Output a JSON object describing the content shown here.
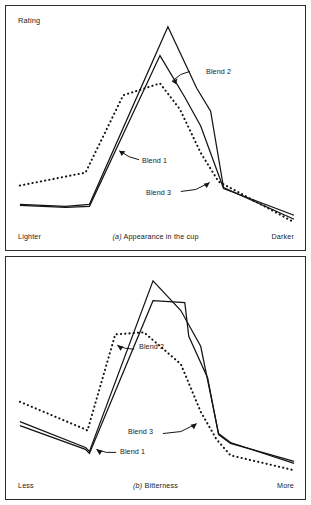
{
  "figure": {
    "y_axis_label": "Rating"
  },
  "panels": [
    {
      "id": "panel-a",
      "caption_prefix": "(a)",
      "caption_text": " Appearance in the cup",
      "axis_left": "Lighter",
      "axis_right": "Darker",
      "annotations": [
        {
          "label": "Blend 2"
        },
        {
          "label": "Blend 1"
        },
        {
          "label": "Blend 3"
        }
      ]
    },
    {
      "id": "panel-b",
      "caption_prefix": "(b)",
      "caption_text": " Bitterness",
      "axis_left": "Less",
      "axis_right": "More",
      "annotations": [
        {
          "label": "Blend 2"
        },
        {
          "label": "Blend 3"
        },
        {
          "label": "Blend 1"
        }
      ]
    }
  ],
  "chart_data": [
    {
      "type": "line",
      "title": "(a) Appearance in the cup",
      "xlabel": "",
      "ylabel": "Rating",
      "xlim": [
        0,
        301
      ],
      "ylim": [
        0,
        246
      ],
      "axis_left_label": "Lighter",
      "axis_right_label": "Darker",
      "grid": false,
      "legend": "inline-annotations",
      "note": "Coordinates are panel-local pixel positions; y increases downward in the source image. Lower y value = higher rating.",
      "series": [
        {
          "name": "Blend 1",
          "style": "solid",
          "color": "#141414",
          "points": [
            [
              14,
              200
            ],
            [
              60,
              202
            ],
            [
              84,
              200
            ],
            [
              163,
              21
            ],
            [
              192,
              83
            ],
            [
              206,
              106
            ],
            [
              219,
              183
            ],
            [
              290,
              215
            ]
          ]
        },
        {
          "name": "Blend 2",
          "style": "solid",
          "color": "#141414",
          "points": [
            [
              14,
              201
            ],
            [
              60,
              203
            ],
            [
              84,
              202
            ],
            [
              155,
              50
            ],
            [
              180,
              92
            ],
            [
              196,
              121
            ],
            [
              219,
              184
            ],
            [
              290,
              211
            ]
          ]
        },
        {
          "name": "Blend 3",
          "style": "dotted",
          "color": "#141414",
          "points": [
            [
              14,
              181
            ],
            [
              80,
              168
            ],
            [
              118,
              90
            ],
            [
              155,
              78
            ],
            [
              175,
              104
            ],
            [
              196,
              148
            ],
            [
              214,
              177
            ],
            [
              290,
              218
            ]
          ]
        }
      ]
    },
    {
      "type": "line",
      "title": "(b) Bitterness",
      "xlabel": "",
      "ylabel": "Rating",
      "xlim": [
        0,
        301
      ],
      "ylim": [
        0,
        244
      ],
      "axis_left_label": "Less",
      "axis_right_label": "More",
      "grid": false,
      "legend": "inline-annotations",
      "note": "Coordinates are panel-local pixel positions; y increases downward in the source image. Lower y value = higher rating.",
      "series": [
        {
          "name": "Blend 1",
          "style": "solid",
          "color": "#141414",
          "points": [
            [
              14,
              166
            ],
            [
              80,
              192
            ],
            [
              84,
              196
            ],
            [
              148,
              24
            ],
            [
              176,
              54
            ],
            [
              196,
              90
            ],
            [
              214,
              178
            ],
            [
              226,
              187
            ],
            [
              290,
              208
            ]
          ]
        },
        {
          "name": "Blend 2",
          "style": "solid",
          "color": "#141414",
          "points": [
            [
              14,
              170
            ],
            [
              80,
              194
            ],
            [
              84,
              198
            ],
            [
              148,
              44
            ],
            [
              180,
              46
            ],
            [
              184,
              80
            ],
            [
              203,
              122
            ],
            [
              214,
              179
            ],
            [
              226,
              188
            ],
            [
              290,
              206
            ]
          ]
        },
        {
          "name": "Blend 3",
          "style": "dotted",
          "color": "#141414",
          "points": [
            [
              14,
              146
            ],
            [
              78,
              173
            ],
            [
              82,
              175
            ],
            [
              110,
              78
            ],
            [
              139,
              76
            ],
            [
              176,
              108
            ],
            [
              196,
              156
            ],
            [
              212,
              184
            ],
            [
              226,
              200
            ],
            [
              290,
              215
            ]
          ]
        }
      ]
    }
  ]
}
